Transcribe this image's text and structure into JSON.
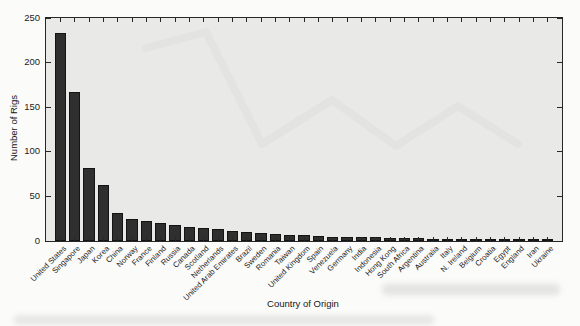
{
  "figure": {
    "page_bg": "#fbfbfa"
  },
  "chart_data": {
    "type": "bar",
    "title": "",
    "xlabel": "Country of Origin",
    "ylabel": "Number of Rigs",
    "ylim": [
      0,
      250
    ],
    "yticks": [
      0,
      50,
      100,
      150,
      200,
      250
    ],
    "grid": false,
    "legend": "none",
    "bar_color": "#2f2f2f",
    "plot_bg": "#e9e9e7",
    "categories": [
      "United States",
      "Singapore",
      "Japan",
      "Korea",
      "China",
      "Norway",
      "France",
      "Finland",
      "Russia",
      "Canada",
      "Scotland",
      "Netherlands",
      "United Arab Emirates",
      "Brazil",
      "Sweden",
      "Romania",
      "Taiwan",
      "United Kingdom",
      "Spain",
      "Venezuela",
      "Germany",
      "India",
      "Indonesia",
      "Hong Kong",
      "South Africa",
      "Argentina",
      "Australia",
      "Italy",
      "N. Ireland",
      "Belgium",
      "Croatia",
      "Egypt",
      "England",
      "Iran",
      "Ukraine"
    ],
    "values": [
      233,
      167,
      82,
      63,
      32,
      25,
      22,
      20,
      18,
      16,
      15,
      13,
      11,
      10,
      9,
      8,
      7,
      7,
      6,
      5,
      5,
      4,
      4,
      3,
      3,
      3,
      2,
      2,
      2,
      2,
      1,
      1,
      1,
      1,
      1
    ]
  }
}
